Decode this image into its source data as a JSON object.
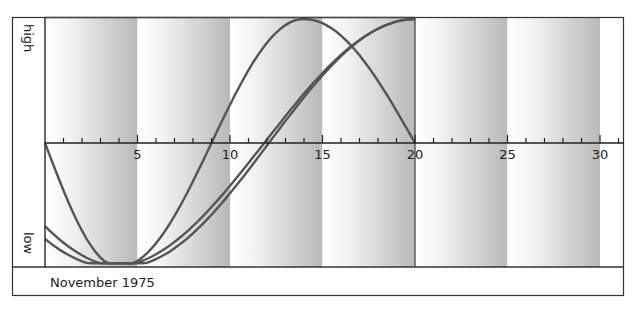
{
  "chart_data": {
    "type": "line",
    "title": "",
    "footer_label": "November 1975",
    "xlabel": "",
    "ylabel_high": "high",
    "ylabel_low": "low",
    "xlim": [
      0,
      31
    ],
    "ylim": [
      -1,
      1
    ],
    "x_ticks": [
      5,
      10,
      15,
      20,
      25,
      30
    ],
    "x_tick_labels": [
      "5",
      "10",
      "15",
      "20",
      "25",
      "30"
    ],
    "minor_tick_step": 1,
    "grid": false,
    "shaded_bands": [
      [
        0,
        5
      ],
      [
        5,
        10
      ],
      [
        10,
        15
      ],
      [
        15,
        20
      ],
      [
        20,
        25
      ],
      [
        25,
        30
      ]
    ],
    "data_end_day": 20,
    "series": [
      {
        "name": "cycle-23",
        "x": [
          0,
          2,
          4,
          6,
          8,
          10,
          12,
          14,
          16,
          18,
          20
        ],
        "y": [
          0.0,
          -0.52,
          -0.89,
          -0.98,
          -0.73,
          -0.27,
          0.27,
          0.98,
          0.73,
          0.52,
          0.0
        ]
      },
      {
        "name": "cycle-28",
        "x": [
          0,
          2,
          4,
          6,
          8,
          10,
          12,
          14,
          16,
          18,
          20
        ],
        "y": [
          -0.73,
          -0.92,
          -0.99,
          -0.9,
          -0.62,
          -0.22,
          0.22,
          0.62,
          0.9,
          0.99,
          1.0
        ]
      },
      {
        "name": "cycle-33",
        "x": [
          0,
          2,
          4,
          6,
          8,
          10,
          12,
          14,
          16,
          18,
          20
        ],
        "y": [
          -0.78,
          -0.96,
          -0.99,
          -0.93,
          -0.72,
          -0.4,
          0.0,
          0.4,
          0.72,
          0.93,
          1.0
        ]
      }
    ]
  },
  "labels": {
    "high": "high",
    "low": "low",
    "footer": "November 1975",
    "ticks": [
      "5",
      "10",
      "15",
      "20",
      "25",
      "30"
    ]
  }
}
